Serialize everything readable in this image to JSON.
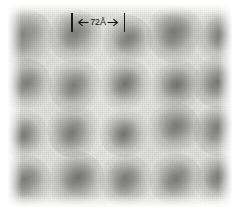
{
  "figure": {
    "kind": "electron-micrograph",
    "background_color": "#f2f2f0",
    "spot_color": "#5f5f5f"
  },
  "scalebar": {
    "label": "72Å",
    "value": 72,
    "unit": "Å",
    "left_arrow": "←",
    "right_arrow": "→",
    "color": "#1a1a1a",
    "pixel_length": 54
  },
  "chart_data": {
    "type": "heatmap",
    "title": "",
    "xlabel": "",
    "ylabel": "",
    "grid": false,
    "legend": false,
    "lattice": {
      "rows": 4,
      "columns": 5,
      "spacing_x_px": 50,
      "spacing_y_px": 48,
      "unit_cell_angstrom": 72
    },
    "spots": [
      {
        "row": 1,
        "col": 1,
        "x": 25,
        "y": 38,
        "r": 17,
        "intensity": 0.62
      },
      {
        "row": 1,
        "col": 2,
        "x": 75,
        "y": 36,
        "r": 16,
        "intensity": 0.74
      },
      {
        "row": 1,
        "col": 3,
        "x": 127,
        "y": 40,
        "r": 15,
        "intensity": 0.66
      },
      {
        "row": 1,
        "col": 4,
        "x": 175,
        "y": 34,
        "r": 17,
        "intensity": 0.82
      },
      {
        "row": 1,
        "col": 5,
        "x": 221,
        "y": 36,
        "r": 16,
        "intensity": 0.7
      },
      {
        "row": 2,
        "col": 1,
        "x": 25,
        "y": 85,
        "r": 16,
        "intensity": 0.64
      },
      {
        "row": 2,
        "col": 2,
        "x": 75,
        "y": 86,
        "r": 16,
        "intensity": 0.68
      },
      {
        "row": 2,
        "col": 3,
        "x": 125,
        "y": 84,
        "r": 16,
        "intensity": 0.76
      },
      {
        "row": 2,
        "col": 4,
        "x": 175,
        "y": 85,
        "r": 16,
        "intensity": 0.8
      },
      {
        "row": 2,
        "col": 5,
        "x": 219,
        "y": 82,
        "r": 16,
        "intensity": 0.78
      },
      {
        "row": 3,
        "col": 1,
        "x": 23,
        "y": 134,
        "r": 15,
        "intensity": 0.66
      },
      {
        "row": 3,
        "col": 2,
        "x": 74,
        "y": 131,
        "r": 16,
        "intensity": 0.74
      },
      {
        "row": 3,
        "col": 3,
        "x": 124,
        "y": 132,
        "r": 15,
        "intensity": 0.72
      },
      {
        "row": 3,
        "col": 4,
        "x": 174,
        "y": 129,
        "r": 16,
        "intensity": 0.76
      },
      {
        "row": 3,
        "col": 5,
        "x": 218,
        "y": 130,
        "r": 15,
        "intensity": 0.74
      },
      {
        "row": 4,
        "col": 1,
        "x": 25,
        "y": 182,
        "r": 16,
        "intensity": 0.7
      },
      {
        "row": 4,
        "col": 2,
        "x": 76,
        "y": 180,
        "r": 17,
        "intensity": 0.8
      },
      {
        "row": 4,
        "col": 3,
        "x": 126,
        "y": 180,
        "r": 16,
        "intensity": 0.74
      },
      {
        "row": 4,
        "col": 4,
        "x": 176,
        "y": 180,
        "r": 16,
        "intensity": 0.76
      },
      {
        "row": 4,
        "col": 5,
        "x": 218,
        "y": 178,
        "r": 15,
        "intensity": 0.78
      }
    ]
  }
}
